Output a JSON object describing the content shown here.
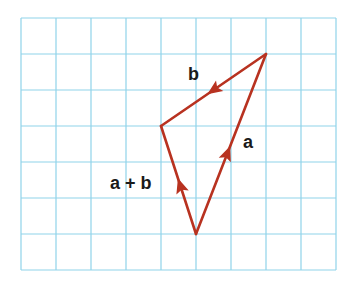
{
  "grid": {
    "x0": 21,
    "y0": 18,
    "cols": 9,
    "rows": 7,
    "cell_w": 35,
    "cell_h": 36,
    "color": "#8fd3ea"
  },
  "vectors": [
    {
      "name": "b",
      "from": [
        266,
        54
      ],
      "to": [
        161,
        126
      ],
      "arrow_at": 0.5,
      "color": "#b83220"
    },
    {
      "name": "a",
      "from": [
        196,
        234
      ],
      "to": [
        266,
        54
      ],
      "arrow_at": 0.45,
      "color": "#b83220"
    },
    {
      "name": "a+b",
      "from": [
        196,
        234
      ],
      "to": [
        161,
        126
      ],
      "arrow_at": 0.45,
      "color": "#b83220"
    }
  ],
  "labels": {
    "b": "b",
    "a": "a",
    "sum": "a + b"
  }
}
